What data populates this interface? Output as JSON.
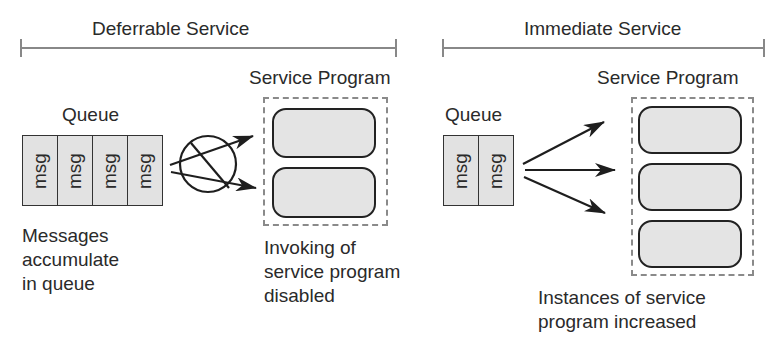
{
  "colors": {
    "ink": "#2a2a2a",
    "stroke": "#222222",
    "bracket": "#888888",
    "dash": "#8a8a8a",
    "fill": "#e3e3e3",
    "background": "#ffffff"
  },
  "deferrable": {
    "title": "Deferrable Service",
    "queue_label": "Queue",
    "queue_items": [
      "msg",
      "msg",
      "msg",
      "msg"
    ],
    "program_label": "Service Program",
    "program_instances": 2,
    "blocked_symbol": "circle-slash (invocation disabled)",
    "queue_caption": [
      "Messages",
      "accumulate",
      "in queue"
    ],
    "program_caption": [
      "Invoking of",
      "service program",
      "disabled"
    ]
  },
  "immediate": {
    "title": "Immediate Service",
    "queue_label": "Queue",
    "queue_items": [
      "msg",
      "msg"
    ],
    "program_label": "Service Program",
    "program_instances": 3,
    "program_caption": [
      "Instances of service",
      "program increased"
    ]
  }
}
